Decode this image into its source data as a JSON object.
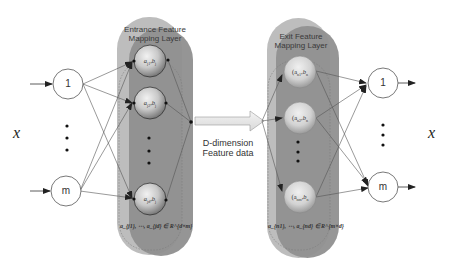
{
  "diagram": {
    "type": "neural-network-architecture",
    "input": {
      "variable": "x",
      "nodes": [
        {
          "label": "1"
        },
        {
          "label": "m"
        }
      ],
      "ellipsis": "⋮"
    },
    "entrance_layer": {
      "title_line1": "Entrance Feature",
      "title_line2": "Mapping Layer",
      "cells": [
        {
          "label": "a_{j1}, b_j"
        },
        {
          "label": "a_{j2}, b_j"
        },
        {
          "label": "a_{jd}, b_j"
        }
      ],
      "formula": "a_{j1}, ⋯, a_{jd} ∈ R^{d×m}"
    },
    "transfer": {
      "line1": "D-dimension",
      "line2": "Feature data"
    },
    "exit_layer": {
      "title_line1": "Exit Feature",
      "title_line2": "Mapping Layer",
      "cells": [
        {
          "label": "(a_{n1}, b_n)"
        },
        {
          "label": "(a_{n2}, b_n)"
        },
        {
          "label": "(a_{nm}, b_n)"
        }
      ],
      "formula": "a_{n1}, ⋯, a_{nd} ∈ R^{m×d}"
    },
    "output": {
      "variable": "x",
      "nodes": [
        {
          "label": "1"
        },
        {
          "label": "m"
        }
      ]
    },
    "colors": {
      "layer_back": "#b8b8b8",
      "layer_front": "#8e8e8e",
      "sphere_light": "#e6e6e6",
      "sphere_dark": "#8a8a8a",
      "line": "#444444"
    }
  },
  "labels": {
    "x_in": "x",
    "x_out": "x",
    "in_node_1": "1",
    "in_node_m": "m",
    "out_node_1": "1",
    "out_node_m": "m",
    "entrance_title_1": "Entrance Feature",
    "entrance_title_2": "Mapping Layer",
    "exit_title_1": "Exit Feature",
    "exit_title_2": "Mapping Layer",
    "feature_line1": "D-dimension",
    "feature_line2": "Feature data",
    "ent_cell_1": "a",
    "ent_cell_1_sub": "j1",
    "ent_cell_2": "a",
    "ent_cell_2_sub": "j2",
    "ent_cell_3": "a",
    "ent_cell_3_sub": "jd",
    "ent_cell_b": "b",
    "ent_cell_b_sub": "j",
    "exit_cell_1": "(a",
    "exit_cell_1_sub": "n1",
    "exit_cell_2": "(a",
    "exit_cell_2_sub": "n2",
    "exit_cell_3": "(a",
    "exit_cell_3_sub": "nm",
    "exit_cell_b": "b",
    "exit_cell_b_sub": "n",
    "ent_formula": "aⱼ₁, ⋯, aⱼd ∈ R^(d×m)",
    "exit_formula": "aₙ₁, ⋯, aₙd ∈ R^(m×d)"
  }
}
